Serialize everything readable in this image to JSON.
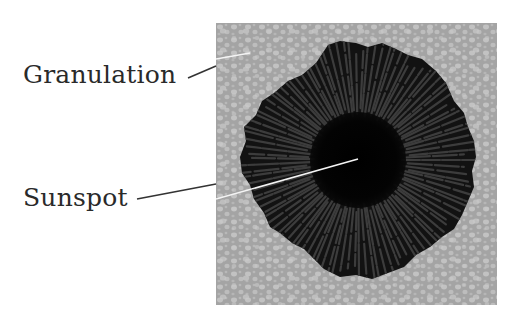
{
  "figure": {
    "labels": [
      {
        "id": "granulation",
        "text": "Granulation"
      },
      {
        "id": "sunspot",
        "text": "Sunspot"
      }
    ]
  },
  "colors": {
    "background": "#ffffff",
    "granulation_base": "#a4a4a4",
    "granulation_cell": "#c4c4c4",
    "penumbra": "#121212",
    "penumbra_filament": "#3c3c3c",
    "umbra": "#030303",
    "label_text": "#2a2a2a",
    "leader_outside": "#333333",
    "leader_inside": "#f4f4f4"
  }
}
